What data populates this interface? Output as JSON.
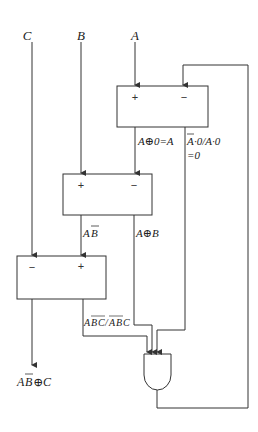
{
  "inputs": {
    "c": "C",
    "b": "B",
    "a": "A"
  },
  "boxes": {
    "top": {
      "plus": "+",
      "minus": "−"
    },
    "middle": {
      "plus": "+",
      "minus": "−"
    },
    "lower": {
      "minus": "−",
      "plus": "+"
    }
  },
  "labels": {
    "a_xor_0": "A⊕0=A",
    "a_not_dot0_line1_a": "A",
    "a_not_dot0_line1_rest": "·0/A·0",
    "a_not_dot0_line2": "=0",
    "a_bbar_a": "A",
    "a_bbar_b": "B",
    "a_xor_b": "A⊕B",
    "abc_combo_a1": "A",
    "abc_combo_b1": "B",
    "abc_combo_c1": "C",
    "abc_combo_slash": "/",
    "abc_combo_a2": "A",
    "abc_combo_b2": "B",
    "abc_combo_c2": "C",
    "output_a": "A",
    "output_b": "B",
    "output_rest": "⊕C"
  }
}
